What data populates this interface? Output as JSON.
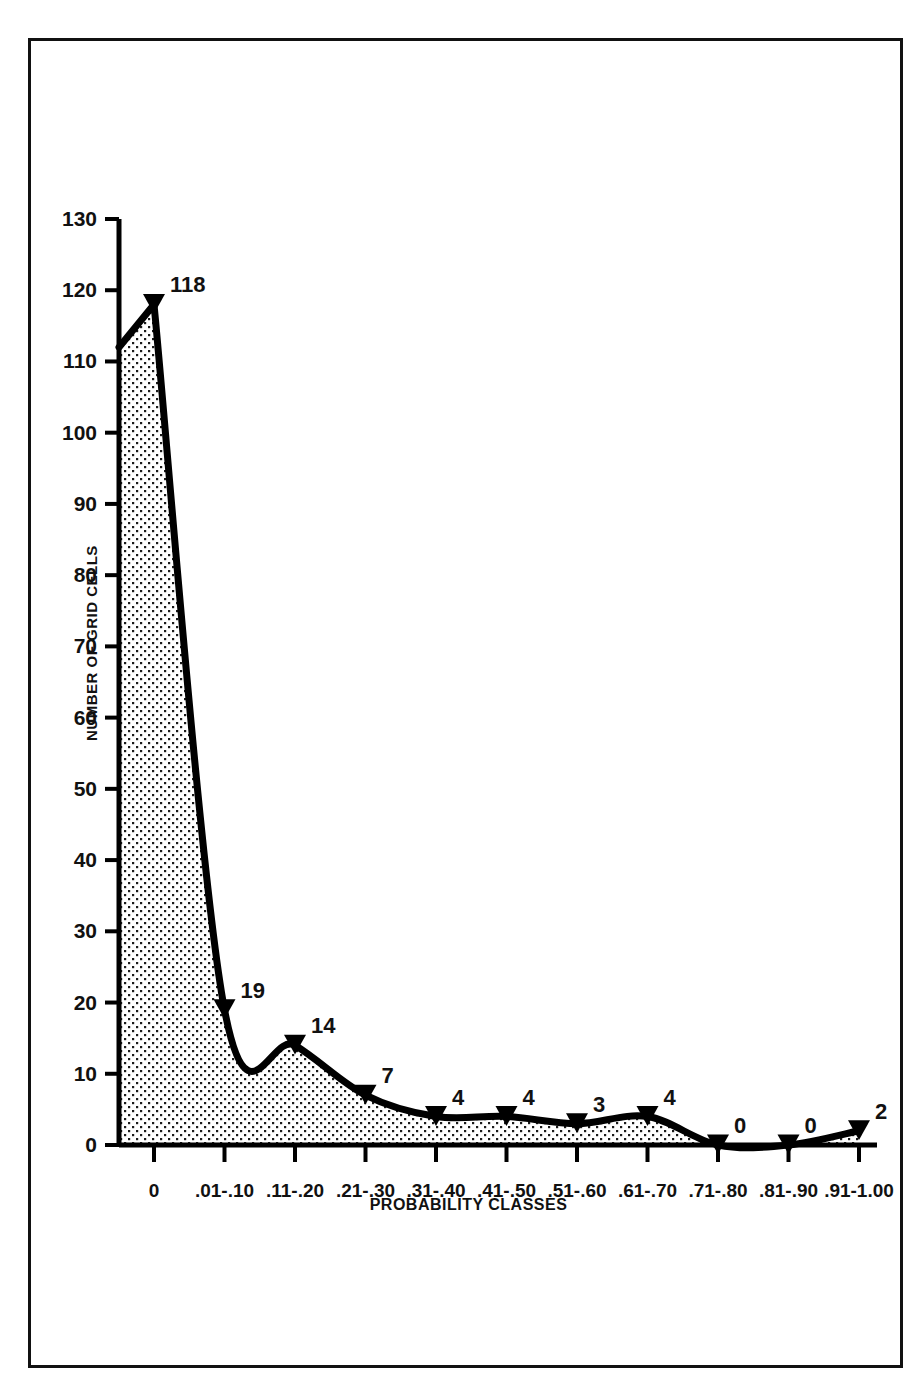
{
  "chart_data": {
    "type": "area",
    "title": "",
    "xlabel": "PROBABILITY CLASSES",
    "ylabel": "NUMBER OF GRID CELLS",
    "categories": [
      "0",
      ".01-.10",
      ".11-.20",
      ".21-.30",
      ".31-.40",
      ".41-.50",
      ".51-.60",
      ".61-.70",
      ".71-.80",
      ".81-.90",
      ".91-1.00"
    ],
    "values": [
      118,
      19,
      14,
      7,
      4,
      4,
      3,
      4,
      0,
      0,
      2
    ],
    "point_labels": [
      "118",
      "19",
      "14",
      "7",
      "4",
      "4",
      "3",
      "4",
      "0",
      "0",
      "2"
    ],
    "ylim": [
      0,
      130
    ],
    "ytick_values": [
      0,
      10,
      20,
      30,
      40,
      50,
      60,
      70,
      80,
      90,
      100,
      110,
      120,
      130
    ],
    "ytick_labels": [
      "0",
      "10",
      "20",
      "30",
      "40",
      "50",
      "60",
      "70",
      "80",
      "90",
      "100",
      "110",
      "120",
      "130"
    ],
    "grid": false,
    "legend": false,
    "fill_pattern": "stipple-dots",
    "marker": "triangle",
    "line_color": "#000000",
    "fill_color": "#ffffff",
    "text_color": "#111111"
  },
  "figure": {
    "frame_visible": true,
    "frame_color": "#111111"
  }
}
